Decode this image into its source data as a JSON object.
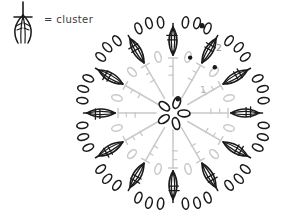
{
  "diagram": {
    "kind": "crochet-stitch-chart",
    "title_visible": false,
    "background_color": "#ffffff"
  },
  "legend": {
    "symbol_name": "cluster-symbol",
    "label": "= cluster",
    "symbol_color": "#1a1a1a",
    "text_color": "#3a3a3a"
  },
  "rounds": [
    {
      "number": "1",
      "label": "1",
      "color": "#c9c9c9",
      "label_color": "#b0b0b0",
      "stitch_count": 12,
      "stitch_type": "double-crochet",
      "chain_count": 12
    },
    {
      "number": "2",
      "label": "2",
      "color": "#1a1a1a",
      "label_color": "#8a8a8a",
      "stitch_count": 12,
      "stitch_type": "cluster",
      "chain_count": 36
    }
  ],
  "center": {
    "name": "magic-ring",
    "chain_ovals": 5,
    "join_marker": "slip-stitch-dot",
    "color": "#1a1a1a"
  },
  "markers": {
    "slip_stitch_dots": 4,
    "color": "#1a1a1a"
  },
  "chart_data": {
    "type": "diagram",
    "title": "",
    "rings": [
      {
        "name": "center-ring",
        "radius": 17,
        "elements": 5,
        "element": "chain",
        "color": "#1a1a1a"
      },
      {
        "name": "round-1-spokes",
        "radius_inner": 17,
        "radius_outer": 55,
        "elements": 12,
        "element": "double-crochet",
        "color": "#c9c9c9"
      },
      {
        "name": "round-1-chains",
        "radius": 58,
        "elements": 12,
        "element": "chain",
        "color": "#c9c9c9"
      },
      {
        "name": "round-2-clusters",
        "radius_inner": 58,
        "radius_outer": 86,
        "elements": 12,
        "element": "cluster",
        "color": "#1a1a1a"
      },
      {
        "name": "round-2-chains",
        "radius": 92,
        "elements": 36,
        "element": "chain",
        "color": "#1a1a1a"
      }
    ],
    "labels": [
      {
        "text": "1",
        "x": 200,
        "y": 90
      },
      {
        "text": "2",
        "x": 215,
        "y": 48
      }
    ]
  }
}
